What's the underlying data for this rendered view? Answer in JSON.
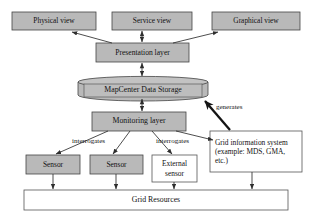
{
  "diagram": {
    "canvas": {
      "width": 311,
      "height": 217
    },
    "colors": {
      "background": "#ffffff",
      "fill_gray": "#b9b9b9",
      "fill_white": "#ffffff",
      "stroke": "#3b3b3b",
      "text": "#111111",
      "thick_arrow": "#1a1a1a"
    },
    "nodes": [
      {
        "id": "physical_view",
        "label": "Physical view",
        "shape": "rect",
        "fill": "gray",
        "x": 12,
        "y": 12,
        "w": 84,
        "h": 18,
        "font": 7.4
      },
      {
        "id": "service_view",
        "label": "Service view",
        "shape": "rect",
        "fill": "gray",
        "x": 112,
        "y": 12,
        "w": 80,
        "h": 18,
        "font": 7.4
      },
      {
        "id": "graphical_view",
        "label": "Graphical view",
        "shape": "rect",
        "fill": "gray",
        "x": 212,
        "y": 12,
        "w": 88,
        "h": 18,
        "font": 7.4
      },
      {
        "id": "presentation_layer",
        "label": "Presentation layer",
        "shape": "rect",
        "fill": "gray",
        "x": 96,
        "y": 43,
        "w": 93,
        "h": 19,
        "font": 7.6
      },
      {
        "id": "data_storage",
        "label": "MapCenter Data Storage",
        "shape": "cylinder",
        "fill": "gray",
        "x": 78,
        "y": 77,
        "w": 130,
        "h": 23,
        "font": 7.8
      },
      {
        "id": "monitoring_layer",
        "label": "Monitoring layer",
        "shape": "rect",
        "fill": "gray",
        "x": 92,
        "y": 112,
        "w": 94,
        "h": 19,
        "font": 7.8
      },
      {
        "id": "grid_info_system",
        "label": "Grid information system (example: MDS, GMA, etc.)",
        "shape": "rect",
        "fill": "white",
        "x": 210,
        "y": 131,
        "w": 92,
        "h": 41,
        "font": 7.4
      },
      {
        "id": "sensor_1",
        "label": "Sensor",
        "shape": "rect",
        "fill": "gray",
        "x": 26,
        "y": 155,
        "w": 54,
        "h": 19,
        "font": 7.4
      },
      {
        "id": "sensor_2",
        "label": "Sensor",
        "shape": "rect",
        "fill": "gray",
        "x": 90,
        "y": 155,
        "w": 53,
        "h": 19,
        "font": 7.4
      },
      {
        "id": "external_sensor",
        "label": "External sensor",
        "shape": "rect",
        "fill": "white",
        "x": 152,
        "y": 155,
        "w": 45,
        "h": 27,
        "font": 7.4
      },
      {
        "id": "grid_resources",
        "label": "Grid Resources",
        "shape": "rect",
        "fill": "white",
        "x": 24,
        "y": 190,
        "w": 264,
        "h": 20,
        "font": 7.8
      }
    ],
    "edge_labels": [
      {
        "id": "generates",
        "text": "generates",
        "x": 216,
        "y": 104,
        "font": 7.0
      },
      {
        "id": "interrogates_left",
        "text": "interrogates",
        "x": 72,
        "y": 138,
        "font": 7.0
      },
      {
        "id": "interrogates_right",
        "text": "interrogates",
        "x": 156,
        "y": 138,
        "font": 7.0
      }
    ],
    "edges": [
      {
        "from": "presentation_layer",
        "to": "physical_view",
        "type": "single-arrow"
      },
      {
        "from": "presentation_layer",
        "to": "service_view",
        "type": "double-arrow-vertical"
      },
      {
        "from": "presentation_layer",
        "to": "graphical_view",
        "type": "single-arrow"
      },
      {
        "from": "presentation_layer",
        "to": "data_storage",
        "type": "double-arrow-vertical"
      },
      {
        "from": "data_storage",
        "to": "monitoring_layer",
        "type": "double-arrow-vertical"
      },
      {
        "from": "grid_info_system",
        "to": "data_storage",
        "type": "thick-arrow",
        "label": "generates"
      },
      {
        "from": "monitoring_layer",
        "to": "sensor_1",
        "type": "single-arrow",
        "label": "interrogates"
      },
      {
        "from": "monitoring_layer",
        "to": "sensor_2",
        "type": "single-arrow"
      },
      {
        "from": "monitoring_layer",
        "to": "external_sensor",
        "type": "single-arrow",
        "label": "interrogates"
      },
      {
        "from": "monitoring_layer",
        "to": "grid_info_system",
        "type": "single-arrow"
      },
      {
        "from": "sensor_1",
        "to": "grid_resources",
        "type": "single-arrow"
      },
      {
        "from": "sensor_2",
        "to": "grid_resources",
        "type": "single-arrow"
      },
      {
        "from": "external_sensor",
        "to": "grid_resources",
        "type": "single-arrow"
      },
      {
        "from": "grid_info_system",
        "to": "grid_resources",
        "type": "single-arrow"
      }
    ]
  }
}
